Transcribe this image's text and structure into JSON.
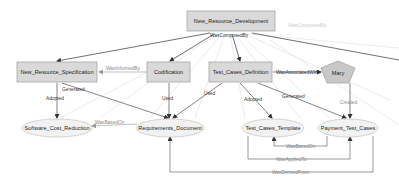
{
  "diagram": {
    "type": "provenance-graph",
    "nodes": {
      "root": {
        "label": "New_Resource_Development",
        "shape": "box"
      },
      "spec": {
        "label": "New_Resource_Specification",
        "shape": "box"
      },
      "cert": {
        "label": "Codification",
        "shape": "box"
      },
      "tcd": {
        "label": "Test_Cases_Definition",
        "shape": "box"
      },
      "mary": {
        "label": "Mary",
        "shape": "pentagon"
      },
      "scr": {
        "label": "Software_Cost_Reduction",
        "shape": "ellipse"
      },
      "req": {
        "label": "Requirements_Document",
        "shape": "ellipse"
      },
      "tct": {
        "label": "Test_Cases_Template",
        "shape": "ellipse"
      },
      "ptc": {
        "label": "Payment_Test_Cases",
        "shape": "ellipse"
      }
    },
    "edges": {
      "composed": "WasComposedBy",
      "composed_ghost": "WasComposedBy",
      "informed": "WasInformedBy",
      "associated": "WasAssociatedWith",
      "spec_generated": "Generated",
      "spec_adopted": "Adopted",
      "cert_used": "Used",
      "tcd_used": "Used",
      "tcd_adopted": "Adopted",
      "tcd_generated": "Generated",
      "mary_created": "Created",
      "req_basedon": "WasBasedOn",
      "ptc_basedon": "WasBasedOn",
      "applied": "WasAppliedTo",
      "derived": "WasDerivedFrom"
    },
    "colors": {
      "box_fill": "#d9d9d9",
      "box_stroke": "#a6a6a6",
      "ellipse_fill": "#f2f2f2",
      "ellipse_stroke": "#c8c8c8",
      "pentagon_fill": "#c8c8c8",
      "edge_dark": "#333333",
      "edge_light": "#9a9a9a",
      "ghost": "#e4e4e4"
    }
  }
}
